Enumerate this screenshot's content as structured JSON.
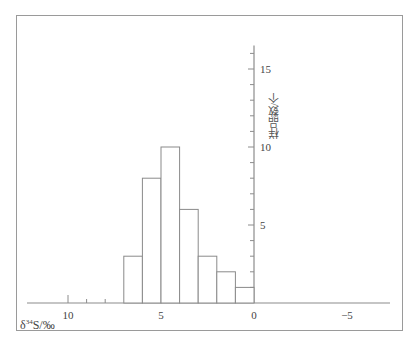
{
  "chart_data": {
    "type": "bar",
    "subtype": "histogram",
    "title": "",
    "xlabel": "δ34S/‰",
    "ylabel": "样品数/个",
    "x_axis_reversed": true,
    "xlim": [
      11.5,
      -7.5
    ],
    "ylim": [
      0,
      16.5
    ],
    "x_ticks": [
      10,
      5,
      0,
      -5
    ],
    "x_tick_labels": [
      "10",
      "5",
      "0",
      "−5"
    ],
    "y_ticks": [
      5,
      10,
      15
    ],
    "y_tick_labels": [
      "5",
      "10",
      "15"
    ],
    "grid": false,
    "legend": null,
    "bins": [
      [
        7,
        6
      ],
      [
        6,
        5
      ],
      [
        5,
        4
      ],
      [
        4,
        3
      ],
      [
        3,
        2
      ],
      [
        2,
        1
      ],
      [
        1,
        0
      ]
    ],
    "categories": [
      "7~6",
      "6~5",
      "5~4",
      "4~3",
      "3~2",
      "2~1",
      "1~0"
    ],
    "values": [
      3,
      8,
      10,
      6,
      3,
      2,
      1
    ]
  },
  "labels": {
    "x_axis_title_prefix": "δ",
    "x_axis_title_sup": "34",
    "x_axis_title_suffix": "S/‰",
    "y_axis_title": "样品数/个"
  }
}
